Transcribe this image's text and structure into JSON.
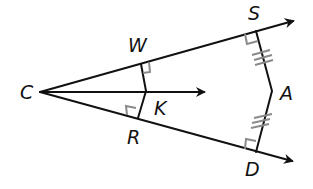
{
  "diagram": {
    "title": "",
    "points": {
      "C": {
        "label": "C",
        "x": 40,
        "y": 92,
        "lx": 27,
        "ly": 99
      },
      "W": {
        "label": "W",
        "x": 141,
        "y": 64,
        "lx": 138,
        "ly": 52
      },
      "K": {
        "label": "K",
        "x": 146,
        "y": 91,
        "lx": 161,
        "ly": 115
      },
      "R": {
        "label": "R",
        "x": 138,
        "y": 118,
        "lx": 133,
        "ly": 144
      },
      "S": {
        "label": "S",
        "x": 256,
        "y": 31,
        "lx": 254,
        "ly": 20
      },
      "A": {
        "label": "A",
        "x": 272,
        "y": 91,
        "lx": 288,
        "ly": 100
      },
      "D": {
        "label": "D",
        "x": 256,
        "y": 152,
        "lx": 252,
        "ly": 176
      }
    },
    "rays": [
      {
        "from": "C",
        "through": "S",
        "description": "ray CS"
      },
      {
        "from": "C",
        "through": "K",
        "description": "ray CK (angle bisector)"
      },
      {
        "from": "C",
        "through": "D",
        "description": "ray CD"
      }
    ],
    "segments": [
      "WK",
      "KR",
      "SA",
      "AD"
    ],
    "right_angles": [
      "W",
      "R",
      "S",
      "D"
    ],
    "congruence_marks": [
      {
        "segment": "SA",
        "ticks": 3
      },
      {
        "segment": "AD",
        "ticks": 3
      }
    ],
    "colors": {
      "line": "#111111",
      "mark": "#8a8a8a"
    }
  }
}
